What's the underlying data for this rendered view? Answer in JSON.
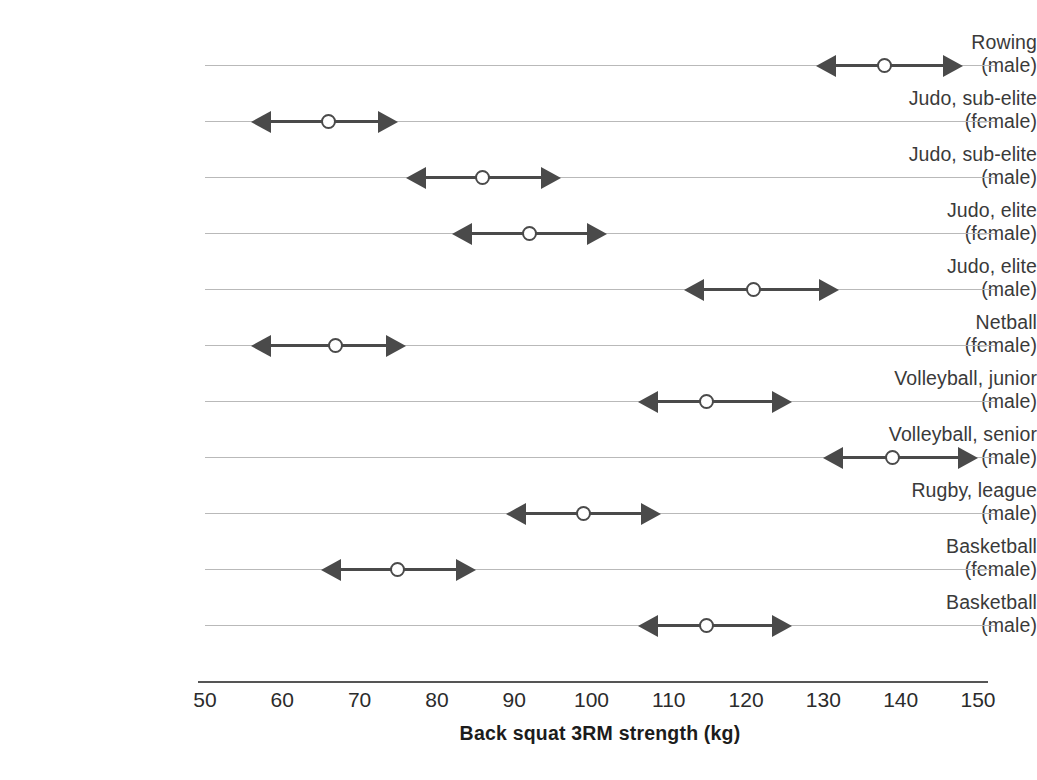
{
  "chart_data": {
    "type": "bar",
    "title": "",
    "subtitle": "",
    "xlabel": "Back squat 3RM strength (kg)",
    "ylabel": "",
    "xlim": [
      50,
      150
    ],
    "xticks": [
      50,
      60,
      70,
      80,
      90,
      100,
      110,
      120,
      130,
      140,
      150
    ],
    "grid": true,
    "legend": null,
    "orientation": "horizontal",
    "marker": "open-circle",
    "range_style": "double-headed-arrow",
    "categories": [
      "Rowing (male)",
      "Judo, sub-elite (female)",
      "Judo, sub-elite (male)",
      "Judo, elite (female)",
      "Judo, elite (male)",
      "Netball (female)",
      "Volleyball, junior (male)",
      "Volleyball, senior (male)",
      "Rugby, league (male)",
      "Basketball (female)",
      "Basketball (male)"
    ],
    "series": [
      {
        "name": "mean",
        "values": [
          138,
          66,
          86,
          92,
          121,
          67,
          115,
          139,
          99,
          75,
          115
        ]
      },
      {
        "name": "low",
        "values": [
          129,
          56,
          76,
          82,
          112,
          56,
          106,
          130,
          89,
          65,
          106
        ]
      },
      {
        "name": "high",
        "values": [
          148,
          75,
          96,
          102,
          132,
          76,
          126,
          150,
          109,
          85,
          126
        ]
      }
    ],
    "rows": [
      {
        "label_line1": "Rowing",
        "label_line2": "(male)",
        "low": 129,
        "mean": 138,
        "high": 148
      },
      {
        "label_line1": "Judo, sub-elite",
        "label_line2": "(female)",
        "low": 56,
        "mean": 66,
        "high": 75
      },
      {
        "label_line1": "Judo, sub-elite",
        "label_line2": "(male)",
        "low": 76,
        "mean": 86,
        "high": 96
      },
      {
        "label_line1": "Judo, elite",
        "label_line2": "(female)",
        "low": 82,
        "mean": 92,
        "high": 102
      },
      {
        "label_line1": "Judo, elite",
        "label_line2": "(male)",
        "low": 112,
        "mean": 121,
        "high": 132
      },
      {
        "label_line1": "Netball",
        "label_line2": "(female)",
        "low": 56,
        "mean": 67,
        "high": 76
      },
      {
        "label_line1": "Volleyball, junior",
        "label_line2": "(male)",
        "low": 106,
        "mean": 115,
        "high": 126
      },
      {
        "label_line1": "Volleyball, senior",
        "label_line2": "(male)",
        "low": 130,
        "mean": 139,
        "high": 150
      },
      {
        "label_line1": "Rugby, league",
        "label_line2": "(male)",
        "low": 89,
        "mean": 99,
        "high": 109
      },
      {
        "label_line1": "Basketball",
        "label_line2": "(female)",
        "low": 65,
        "mean": 75,
        "high": 85
      },
      {
        "label_line1": "Basketball",
        "label_line2": "(male)",
        "low": 106,
        "mean": 115,
        "high": 126
      }
    ]
  },
  "style": {
    "line_color": "#4a4a4a",
    "grid_color": "#b9b9b9",
    "axis_color": "#555555",
    "label_color": "#3a3a3a",
    "background": "#ffffff"
  }
}
